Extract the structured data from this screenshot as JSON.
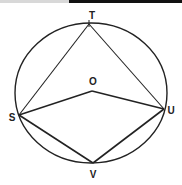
{
  "diagram": {
    "title": "",
    "circle": {
      "cx": 91,
      "cy": 93,
      "rx": 76,
      "ry": 70,
      "stroke": "#222222"
    },
    "points": {
      "T": {
        "x": 89,
        "y": 24,
        "label": "T",
        "lx": 92,
        "ly": 19
      },
      "O": {
        "x": 92,
        "y": 91,
        "label": "O",
        "lx": 93,
        "ly": 84
      },
      "S": {
        "x": 19,
        "y": 115,
        "label": "S",
        "lx": 12,
        "ly": 121
      },
      "U": {
        "x": 164,
        "y": 109,
        "label": "U",
        "lx": 170,
        "ly": 113
      },
      "V": {
        "x": 93,
        "y": 163,
        "label": "V",
        "lx": 93,
        "ly": 177
      }
    },
    "segments": [
      [
        "S",
        "T"
      ],
      [
        "T",
        "U"
      ],
      [
        "S",
        "O"
      ],
      [
        "O",
        "U"
      ],
      [
        "S",
        "V"
      ],
      [
        "V",
        "U"
      ]
    ],
    "labels": {
      "T": "T",
      "O": "O",
      "S": "S",
      "U": "U",
      "V": "V"
    }
  },
  "top_strip": {
    "light_color": "#d8d8d8",
    "dark_color": "#111111"
  }
}
